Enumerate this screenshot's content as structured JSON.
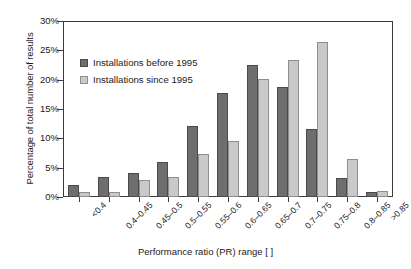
{
  "chart_data": {
    "type": "bar",
    "title": "",
    "xlabel": "Performance ratio (PR) range [ ]",
    "ylabel": "Percentage of total number of results",
    "categories": [
      "<0.4",
      "0.4–0.45",
      "0.45–0.5",
      "0.5–0.55",
      "0.55–0.6",
      "0.6–0.65",
      "0.65–0.7",
      "0.7–0.75",
      "0.75–0.8",
      "0.8–0.85",
      ">0.85"
    ],
    "series": [
      {
        "name": "Installations before 1995",
        "color": "#6e6e6e",
        "values": [
          2.0,
          3.5,
          4.1,
          6.0,
          12.1,
          17.8,
          22.7,
          18.9,
          11.6,
          3.2,
          0.9
        ]
      },
      {
        "name": "Installations since 1995",
        "color": "#c9c9c9",
        "values": [
          0.8,
          0.9,
          2.9,
          3.4,
          7.3,
          9.6,
          20.2,
          23.5,
          26.6,
          6.6,
          1.0
        ]
      }
    ],
    "ylim": [
      0,
      30
    ],
    "yticks": [
      "0%",
      "5%",
      "10%",
      "15%",
      "20%",
      "25%",
      "30%"
    ],
    "ytick_values": [
      0,
      5,
      10,
      15,
      20,
      25,
      30
    ],
    "grid": false,
    "legend_position": "upper-left-inside"
  },
  "legend": {
    "items": [
      {
        "label": "Installations before 1995"
      },
      {
        "label": "Installations since 1995"
      }
    ]
  }
}
